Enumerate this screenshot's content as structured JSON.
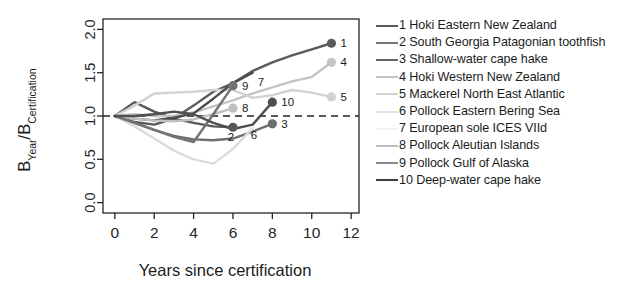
{
  "chart_data": {
    "type": "line",
    "title": "",
    "xlabel": "Years since certification",
    "ylabel": "B_Year / B_Certification",
    "ylabel_parts": {
      "b1": "B",
      "sub1": "Year",
      "slash": "/",
      "b2": "B",
      "sub2": "Certification"
    },
    "xlim": [
      -0.6,
      12.4
    ],
    "ylim": [
      -0.12,
      2.12
    ],
    "xticks": [
      0,
      2,
      4,
      6,
      8,
      10,
      12
    ],
    "xtick_labels": [
      "0",
      "2",
      "4",
      "6",
      "8",
      "10",
      "12"
    ],
    "yticks": [
      0.0,
      0.5,
      1.0,
      1.5,
      2.0
    ],
    "ytick_labels": [
      "0.0",
      "0.5",
      "1.0",
      "1.5",
      "2.0"
    ],
    "grid": false,
    "legend_position": "right",
    "reference_line": {
      "y": 1.0,
      "style": "dashed",
      "color": "#222222"
    },
    "series": [
      {
        "id": 1,
        "name": "Hoki Eastern New Zealand",
        "color": "#5a5a5a",
        "end_label": "1",
        "end_marker": true,
        "x": [
          0,
          1,
          2,
          3,
          4,
          5,
          6,
          7,
          8,
          9,
          10,
          11
        ],
        "y": [
          1.0,
          0.93,
          0.9,
          0.97,
          1.12,
          1.28,
          1.38,
          1.52,
          1.62,
          1.7,
          1.77,
          1.84
        ]
      },
      {
        "id": 2,
        "name": "South Georgia Patagonian toothfish",
        "color": "#585858",
        "end_label": "2",
        "end_marker": true,
        "x": [
          0,
          1,
          2,
          3,
          4,
          5,
          6
        ],
        "y": [
          1.0,
          1.16,
          1.05,
          0.97,
          0.92,
          0.88,
          0.87
        ]
      },
      {
        "id": 3,
        "name": "Shallow-water cape hake",
        "color": "#6e6e6e",
        "end_label": "3",
        "end_marker": true,
        "x": [
          0,
          1,
          2,
          3,
          4,
          5,
          6,
          7,
          8
        ],
        "y": [
          1.0,
          0.92,
          0.84,
          0.77,
          0.73,
          0.72,
          0.74,
          0.82,
          0.91
        ]
      },
      {
        "id": 4,
        "name": "Hoki Western New Zealand",
        "color": "#c4c4c4",
        "end_label": "4",
        "end_marker": true,
        "x": [
          0,
          1,
          2,
          3,
          4,
          5,
          6,
          7,
          8,
          9,
          10,
          11
        ],
        "y": [
          1.0,
          1.02,
          1.0,
          1.0,
          1.04,
          1.11,
          1.18,
          1.26,
          1.33,
          1.4,
          1.45,
          1.62
        ]
      },
      {
        "id": 5,
        "name": "Mackerel North East Atlantic",
        "color": "#d2d2d2",
        "end_label": "5",
        "end_marker": true,
        "x": [
          0,
          1,
          2,
          3,
          4,
          5,
          6,
          7,
          8,
          9,
          10,
          11
        ],
        "y": [
          1.0,
          1.12,
          1.26,
          1.27,
          1.28,
          1.3,
          1.3,
          1.21,
          1.24,
          1.3,
          1.27,
          1.22
        ]
      },
      {
        "id": 6,
        "name": "Pollock Eastern Bering Sea",
        "color": "#dcdcdc",
        "end_label": "6",
        "end_marker": false,
        "x": [
          0,
          1,
          2,
          3,
          4,
          5,
          6,
          7
        ],
        "y": [
          1.0,
          0.88,
          0.74,
          0.6,
          0.5,
          0.45,
          0.62,
          0.86
        ]
      },
      {
        "id": 7,
        "name": "European sole ICES VIId",
        "color": "#4b4b4b",
        "end_label": "7",
        "end_marker": false,
        "x": [
          0,
          1,
          2,
          3,
          4,
          5,
          6,
          7
        ],
        "y": [
          1.0,
          0.97,
          0.95,
          0.98,
          1.03,
          1.2,
          1.38,
          1.5
        ]
      },
      {
        "id": 8,
        "name": "Pollock Aleutian Islands",
        "color": "#c0c0c0",
        "end_label": "8",
        "end_marker": true,
        "x": [
          0,
          1,
          2,
          3,
          4,
          5,
          6
        ],
        "y": [
          1.0,
          0.97,
          0.95,
          0.94,
          0.96,
          1.02,
          1.09
        ]
      },
      {
        "id": 9,
        "name": "Pollock Gulf of Alaska",
        "color": "#737373",
        "end_label": "9",
        "end_marker": true,
        "x": [
          0,
          1,
          2,
          3,
          4,
          5,
          6
        ],
        "y": [
          1.0,
          0.92,
          0.84,
          0.76,
          0.7,
          1.02,
          1.35
        ]
      },
      {
        "id": 10,
        "name": "Deep-water cape hake",
        "color": "#4f4f4f",
        "end_label": "10",
        "end_marker": true,
        "x": [
          0,
          1,
          2,
          3,
          4,
          5,
          6,
          7,
          8
        ],
        "y": [
          1.0,
          1.0,
          1.02,
          1.05,
          1.02,
          0.92,
          0.85,
          0.9,
          1.16
        ]
      }
    ]
  },
  "legend": {
    "items": [
      {
        "num": "1",
        "label": "1 Hoki Eastern New Zealand",
        "color": "#5a5a5a"
      },
      {
        "num": "2",
        "label": "2 South Georgia Patagonian toothfish",
        "color": "#777777"
      },
      {
        "num": "3",
        "label": "3 Shallow-water cape hake",
        "color": "#666666"
      },
      {
        "num": "4",
        "label": "4 Hoki Western New Zealand",
        "color": "#c4c4c4"
      },
      {
        "num": "5",
        "label": "5 Mackerel North East Atlantic",
        "color": "#d2d2d2"
      },
      {
        "num": "6",
        "label": "6 Pollock Eastern Bering Sea",
        "color": "#e2e2e2"
      },
      {
        "num": "7",
        "label": "7 European sole ICES VIId",
        "color": "#f2f2f2"
      },
      {
        "num": "8",
        "label": "8 Pollock Aleutian Islands",
        "color": "#bdbdbd"
      },
      {
        "num": "9",
        "label": "9 Pollock Gulf of Alaska",
        "color": "#8a8a8a"
      },
      {
        "num": "10",
        "label": "10 Deep-water cape hake",
        "color": "#3f3f3f"
      }
    ]
  }
}
